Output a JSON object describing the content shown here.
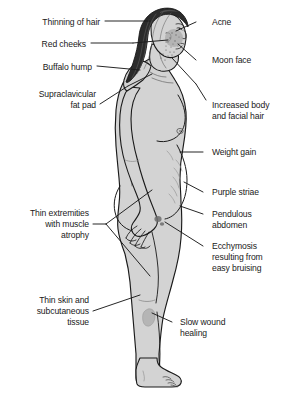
{
  "illustration": {
    "title": "Clinical manifestations of Cushing syndrome",
    "subject": "female-figure-lateral-profile",
    "background_color": "#ffffff",
    "skin_fill": "#d3d3d3",
    "hair_fill": "#2b2b2b",
    "outline_color": "#1a1a1a",
    "text_color": "#1a1a1a"
  },
  "labels": {
    "left": [
      {
        "id": "thinning-of-hair",
        "text": "Thinning of hair"
      },
      {
        "id": "red-cheeks",
        "text": "Red cheeks"
      },
      {
        "id": "buffalo-hump",
        "text": "Buffalo hump"
      },
      {
        "id": "supraclavicular-fat-pad",
        "text": "Supraclavicular\nfat pad"
      },
      {
        "id": "thin-extremities-atrophy",
        "text": "Thin extremities\nwith muscle\natrophy"
      },
      {
        "id": "thin-skin-subcutaneous",
        "text": "Thin skin and\nsubcutaneous\ntissue"
      }
    ],
    "right": [
      {
        "id": "acne",
        "text": "Acne"
      },
      {
        "id": "moon-face",
        "text": "Moon face"
      },
      {
        "id": "increased-body-facial-hair",
        "text": "Increased body\nand facial hair"
      },
      {
        "id": "weight-gain",
        "text": "Weight gain"
      },
      {
        "id": "purple-striae",
        "text": "Purple striae"
      },
      {
        "id": "pendulous-abdomen",
        "text": "Pendulous\nabdomen"
      },
      {
        "id": "ecchymosis-easy-bruising",
        "text": "Ecchymosis\nresulting from\neasy bruising"
      },
      {
        "id": "slow-wound-healing",
        "text": "Slow wound\nhealing"
      }
    ]
  }
}
